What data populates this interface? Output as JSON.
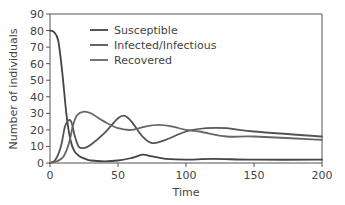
{
  "chart_data": {
    "type": "line",
    "title": "",
    "xlabel": "Time",
    "ylabel": "Number of individuals",
    "xlim": [
      0,
      200
    ],
    "ylim": [
      0,
      90
    ],
    "xticks": [
      0,
      50,
      100,
      150,
      200
    ],
    "yticks": [
      0,
      10,
      20,
      30,
      40,
      50,
      60,
      70,
      80,
      90
    ],
    "grid": false,
    "legend_position": "upper center",
    "series": [
      {
        "name": "Susceptible",
        "color": "#444444",
        "x": [
          0,
          3,
          6,
          9,
          12,
          15,
          18,
          22,
          26,
          30,
          40,
          50,
          60,
          68,
          75,
          85,
          100,
          120,
          150,
          200
        ],
        "values": [
          80,
          79,
          74,
          55,
          30,
          14,
          7,
          4,
          2.5,
          1.5,
          1,
          1.5,
          3,
          5,
          4,
          2.5,
          2,
          2.5,
          2,
          2
        ]
      },
      {
        "name": "Infected/Infectious",
        "color": "#555555",
        "x": [
          0,
          4,
          8,
          11,
          14,
          16,
          18,
          21,
          25,
          30,
          40,
          50,
          55,
          60,
          68,
          75,
          85,
          100,
          115,
          130,
          150,
          200
        ],
        "values": [
          0,
          2,
          10,
          22,
          26,
          24,
          17,
          10,
          9,
          11,
          18,
          27,
          28.5,
          25,
          16,
          12,
          14,
          19,
          21,
          21,
          19,
          16
        ]
      },
      {
        "name": "Recovered",
        "color": "#666666",
        "x": [
          0,
          5,
          10,
          14,
          17,
          20,
          25,
          30,
          40,
          50,
          60,
          70,
          80,
          90,
          100,
          110,
          130,
          150,
          200
        ],
        "values": [
          0,
          1,
          4,
          12,
          23,
          29,
          31,
          30,
          25,
          21,
          20,
          22,
          23,
          22,
          20,
          19,
          16,
          16,
          14
        ]
      }
    ]
  },
  "axes": {
    "xlabel": "Time",
    "ylabel": "Number of individuals",
    "xtick_labels": [
      "0",
      "50",
      "100",
      "150",
      "200"
    ],
    "ytick_labels": [
      "0",
      "10",
      "20",
      "30",
      "40",
      "50",
      "60",
      "70",
      "80",
      "90"
    ]
  },
  "legend": {
    "items": [
      {
        "label": "Susceptible",
        "color": "#444444"
      },
      {
        "label": "Infected/Infectious",
        "color": "#555555"
      },
      {
        "label": "Recovered",
        "color": "#666666"
      }
    ]
  }
}
